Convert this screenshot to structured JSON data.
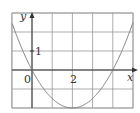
{
  "chart_data": {
    "type": "line",
    "title": "",
    "xlabel": "x",
    "ylabel": "y",
    "xlim": [
      -1,
      5
    ],
    "ylim": [
      -2,
      3
    ],
    "grid": true,
    "tick_labels": {
      "x": [
        "0",
        "2"
      ],
      "y": [
        "1"
      ]
    },
    "function": "y = x^2/2 - 2x",
    "series": [
      {
        "name": "curve",
        "x": [
          -1,
          -0.5,
          0,
          0.5,
          1,
          1.5,
          2,
          2.5,
          3,
          3.5,
          4,
          4.5,
          5
        ],
        "y": [
          2.5,
          1.125,
          0,
          -0.875,
          -1.5,
          -1.875,
          -2,
          -1.875,
          -1.5,
          -0.875,
          0,
          1.125,
          2.5
        ]
      }
    ],
    "annotations": {
      "vertex": [
        2,
        -2
      ],
      "roots": [
        0,
        4
      ]
    }
  },
  "labels": {
    "y_axis": "y",
    "x_axis": "x",
    "origin": "0",
    "x_tick": "2",
    "y_tick": "1"
  },
  "colors": {
    "grid": "#8a8a8a",
    "axis": "#333333",
    "curve": "#7a7a7a",
    "frame": "#9a9a9a"
  }
}
